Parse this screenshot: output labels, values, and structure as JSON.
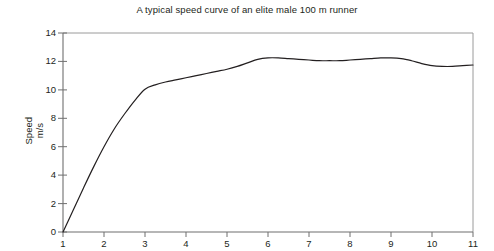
{
  "chart_data": {
    "type": "line",
    "title": "A typical speed curve of an elite male 100 m runner",
    "xlabel": "",
    "ylabel": "Speed m/s",
    "ylabel_lines": [
      "Speed",
      "m/s"
    ],
    "xlim": [
      1,
      11
    ],
    "ylim": [
      0,
      14
    ],
    "xticks": [
      1,
      2,
      3,
      4,
      5,
      6,
      7,
      8,
      9,
      10,
      11
    ],
    "xtick_labels": [
      "1",
      "2",
      "3",
      "4",
      "5",
      "6",
      "7",
      "8",
      "9",
      "10",
      "11"
    ],
    "yticks": [
      0,
      2,
      4,
      6,
      8,
      10,
      12,
      14
    ],
    "ytick_labels": [
      "0",
      "2",
      "4",
      "6",
      "8",
      "10",
      "12",
      "14"
    ],
    "grid": false,
    "legend": null,
    "line_color": "#231f20",
    "frame_color": "#8d8d8d",
    "background": "#ffffff",
    "series": [
      {
        "name": "Speed",
        "x": [
          1.0,
          1.25,
          1.5,
          1.75,
          2.0,
          2.25,
          2.5,
          2.75,
          3.0,
          3.25,
          3.5,
          3.75,
          4.0,
          4.25,
          4.5,
          4.75,
          5.0,
          5.25,
          5.5,
          5.75,
          6.0,
          6.25,
          6.5,
          6.75,
          7.0,
          7.25,
          7.5,
          7.75,
          8.0,
          8.25,
          8.5,
          8.75,
          9.0,
          9.25,
          9.5,
          9.75,
          10.0,
          10.25,
          10.5,
          10.75,
          11.0
        ],
        "values": [
          0.0,
          1.55,
          3.1,
          4.6,
          6.0,
          7.25,
          8.3,
          9.25,
          10.05,
          10.35,
          10.55,
          10.7,
          10.85,
          11.0,
          11.15,
          11.3,
          11.45,
          11.65,
          11.9,
          12.15,
          12.25,
          12.25,
          12.2,
          12.15,
          12.1,
          12.05,
          12.05,
          12.05,
          12.1,
          12.15,
          12.2,
          12.25,
          12.25,
          12.2,
          12.05,
          11.85,
          11.7,
          11.65,
          11.65,
          11.7,
          11.75
        ]
      }
    ]
  }
}
